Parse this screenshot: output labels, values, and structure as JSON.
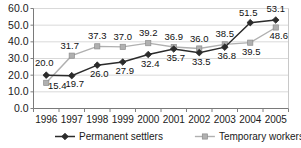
{
  "chart_data": {
    "type": "line",
    "title": "",
    "subtitle": "",
    "xlabel": "",
    "ylabel": "",
    "categories": [
      "1996",
      "1997",
      "1998",
      "1999",
      "2000",
      "2001",
      "2002",
      "2003",
      "2004",
      "2005"
    ],
    "series": [
      {
        "name": "Permanent settlers",
        "marker": "diamond",
        "color": "#2b2b2b",
        "values": [
          20.0,
          19.7,
          26.0,
          27.9,
          32.4,
          35.7,
          33.5,
          36.8,
          51.5,
          53.1
        ],
        "labels": [
          "20.0",
          "19.7",
          "26.0",
          "27.9",
          "32.4",
          "35.7",
          "33.5",
          "36.8",
          "51.5",
          "53.1"
        ]
      },
      {
        "name": "Temporary workers",
        "marker": "square",
        "color": "#b0b0b0",
        "values": [
          15.4,
          31.7,
          37.3,
          37.0,
          39.2,
          36.9,
          36.0,
          38.5,
          39.5,
          48.6
        ],
        "labels": [
          "15.4",
          "31.7",
          "37.3",
          "37.0",
          "39.2",
          "36.9",
          "36.0",
          "38.5",
          "39.5",
          "48.6"
        ]
      }
    ],
    "ylim": [
      0.0,
      60.0
    ],
    "ytick_labels": [
      "60.0",
      "50.0",
      "40.0",
      "30.0",
      "20.0",
      "10.0",
      "0.0"
    ],
    "ytick_values": [
      60.0,
      50.0,
      40.0,
      30.0,
      20.0,
      10.0,
      0.0
    ],
    "grid": true,
    "grid_color": "#d9d9d9",
    "legend_position": "bottom",
    "legend": [
      {
        "label": "Permanent settlers",
        "marker": "diamond",
        "color": "#2b2b2b"
      },
      {
        "label": "Temporary workers",
        "marker": "square",
        "color": "#b0b0b0"
      }
    ]
  }
}
